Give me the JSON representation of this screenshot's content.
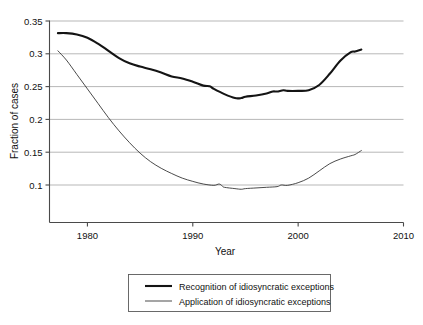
{
  "chart_data": {
    "type": "line",
    "title": "",
    "xlabel": "Year",
    "ylabel": "Fraction of cases",
    "xlim": [
      1976.4,
      2010
    ],
    "ylim": [
      0.085,
      0.35
    ],
    "xticks": [
      1980,
      1990,
      2000,
      2010
    ],
    "yticks": [
      0.1,
      0.15,
      0.2,
      0.25,
      0.3,
      0.35
    ],
    "xtick_labels": [
      "1980",
      "1990",
      "2000",
      "2010"
    ],
    "ytick_labels": [
      "0.1",
      "0.15",
      "0.2",
      "0.25",
      "0.3",
      "0.35"
    ],
    "grid": "horizontal",
    "legend_position": "below-bottom-center",
    "series": [
      {
        "name": "Recognition of idiosyncratic exceptions",
        "style": "thick",
        "x": [
          1977.2,
          1978,
          1979,
          1980,
          1981,
          1982,
          1983,
          1984,
          1985,
          1986,
          1987,
          1988,
          1989,
          1990,
          1991,
          1991.6,
          1992,
          1993,
          1994,
          1994.6,
          1995,
          1996,
          1997,
          1997.6,
          1998,
          1998.6,
          1999,
          2000,
          2001,
          2002,
          2003,
          2004,
          2005,
          2005.4,
          2006
        ],
        "y": [
          0.3315,
          0.3315,
          0.3295,
          0.3245,
          0.3155,
          0.3045,
          0.2935,
          0.2855,
          0.2805,
          0.2765,
          0.2715,
          0.2655,
          0.2625,
          0.2575,
          0.2515,
          0.2505,
          0.2465,
          0.2385,
          0.2325,
          0.2325,
          0.2345,
          0.2365,
          0.2395,
          0.2425,
          0.2425,
          0.2445,
          0.2435,
          0.2435,
          0.2445,
          0.2525,
          0.2695,
          0.2895,
          0.3025,
          0.3035,
          0.3065
        ]
      },
      {
        "name": "Application of idiosyncratic exceptions",
        "style": "thin",
        "x": [
          1977.2,
          1978,
          1979,
          1980,
          1981,
          1982,
          1983,
          1984,
          1985,
          1986,
          1987,
          1988,
          1989,
          1990,
          1991,
          1992,
          1992.5,
          1992.8,
          1993,
          1994,
          1994.6,
          1995,
          1996,
          1997,
          1998,
          1998.4,
          1999,
          2000,
          2001,
          2002,
          2003,
          2004,
          2005,
          2005.4,
          2006
        ],
        "y": [
          0.3045,
          0.2905,
          0.2685,
          0.2465,
          0.2245,
          0.2025,
          0.1825,
          0.1645,
          0.1485,
          0.1355,
          0.1255,
          0.1175,
          0.1105,
          0.1055,
          0.1015,
          0.0995,
          0.1015,
          0.0985,
          0.0965,
          0.0945,
          0.0935,
          0.0945,
          0.0955,
          0.0965,
          0.0975,
          0.1,
          0.0995,
          0.1035,
          0.1105,
          0.1215,
          0.1325,
          0.1395,
          0.1445,
          0.1465,
          0.1525
        ]
      }
    ]
  },
  "legend": {
    "entries": [
      {
        "label": "Recognition of idiosyncratic exceptions",
        "style": "thick"
      },
      {
        "label": "Application of idiosyncratic exceptions",
        "style": "thin"
      }
    ]
  }
}
